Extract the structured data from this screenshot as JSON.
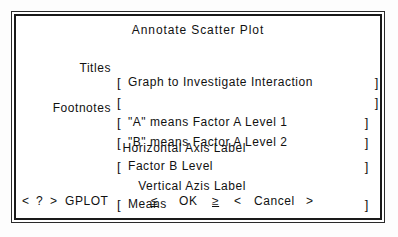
{
  "dialog": {
    "title": "Annotate Scatter Plot",
    "rows": [
      {
        "label": "Titles",
        "open": "[",
        "value": "Graph to Investigate Interaction",
        "close": "]"
      },
      {
        "label": "",
        "open": "[",
        "value": "",
        "close": "]"
      },
      {
        "label": "Footnotes",
        "open": "[",
        "value": "\"A\" means Factor A Level 1",
        "close": "]"
      },
      {
        "label": "",
        "open": "[",
        "value": "\"B\" means Factor A Level 2",
        "close": "]"
      },
      {
        "label": "Horizontal Axis Label",
        "open": "[",
        "value": "Factor B Level",
        "close": "]"
      },
      {
        "label": "Vertical Azis Label",
        "open": "[",
        "value": "Means",
        "close": "]"
      }
    ],
    "section_labels": {
      "horizontal_axis": "Horizontal Axis Label",
      "vertical_axis": "Vertical Azis Label"
    }
  },
  "command_bar": {
    "help_prev": "<",
    "help": "?",
    "help_next": ">",
    "procedure": "GPLOT",
    "ok_prev": "≤",
    "ok": "OK",
    "ok_next": "≥",
    "cancel_prev": "<",
    "cancel": "Cancel",
    "cancel_next": ">"
  }
}
